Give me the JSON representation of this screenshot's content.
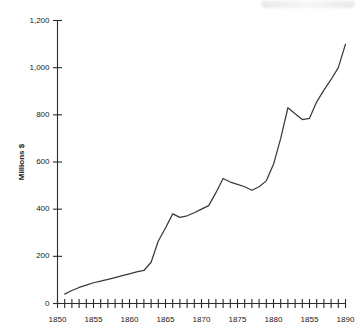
{
  "chart_data": {
    "type": "line",
    "title": "",
    "xlabel": "",
    "ylabel": "Millions $",
    "xlim": [
      1850,
      1890
    ],
    "ylim": [
      0,
      1200
    ],
    "grid": false,
    "legend": null,
    "y_ticks": [
      0,
      200,
      400,
      600,
      800,
      1000,
      1200
    ],
    "y_tick_labels": [
      "0",
      "200",
      "400",
      "600",
      "800",
      "1,000",
      "1,200"
    ],
    "x_tick_labels": [
      "1850",
      "1855",
      "1860",
      "1865",
      "1870",
      "1875",
      "1880",
      "1855",
      "1890"
    ],
    "x_tick_label_years": [
      1850,
      1855,
      1860,
      1865,
      1870,
      1875,
      1880,
      1885,
      1890
    ],
    "x_minor_tick_step": 1,
    "x": [
      1851,
      1852,
      1853,
      1854,
      1855,
      1856,
      1857,
      1858,
      1859,
      1860,
      1861,
      1862,
      1863,
      1864,
      1865,
      1866,
      1867,
      1868,
      1869,
      1870,
      1871,
      1872,
      1873,
      1874,
      1875,
      1876,
      1877,
      1878,
      1879,
      1880,
      1881,
      1882,
      1883,
      1884,
      1885,
      1886,
      1887,
      1888,
      1889,
      1890
    ],
    "values": [
      40,
      55,
      68,
      78,
      88,
      95,
      102,
      110,
      118,
      126,
      134,
      140,
      175,
      265,
      320,
      380,
      365,
      372,
      385,
      400,
      415,
      470,
      530,
      515,
      505,
      495,
      480,
      495,
      520,
      590,
      700,
      830,
      805,
      780,
      785,
      855,
      905,
      950,
      1000,
      1100
    ],
    "series_name": "",
    "annotations": []
  },
  "axes": {
    "y_axis_title": "Millions $"
  }
}
